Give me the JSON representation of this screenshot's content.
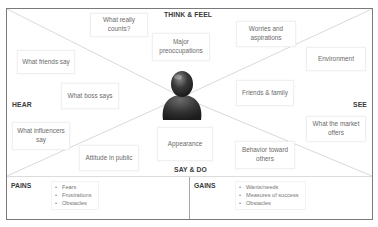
{
  "diagram": {
    "type": "empathy-map",
    "sections": {
      "top": "THINK & FEEL",
      "left": "HEAR",
      "right": "SEE",
      "bottom": "SAY & DO"
    },
    "think_feel_notes": [
      "What really counts?",
      "Major preoccupations",
      "Worries and aspirations"
    ],
    "hear_notes": [
      "What friends say",
      "What boss says",
      "What influencers say"
    ],
    "see_notes": [
      "Environment",
      "Friends & family",
      "What the market offers"
    ],
    "say_do_notes": [
      "Attitude in public",
      "Appearance",
      "Behavior toward others"
    ],
    "center_icon": "person-icon",
    "pains": {
      "title": "PAINS",
      "items": [
        "Fears",
        "Frustrations",
        "Obstacles"
      ]
    },
    "gains": {
      "title": "GAINS",
      "items": [
        "Wants/needs",
        "Measures of success",
        "Obstacles"
      ]
    },
    "colors": {
      "border": "#7a7a7a",
      "divider_lines": "#d9d9d9",
      "label_text": "#3a3a3a",
      "note_text": "#6a6a6a",
      "person_fill": "#3c3c3c"
    }
  }
}
